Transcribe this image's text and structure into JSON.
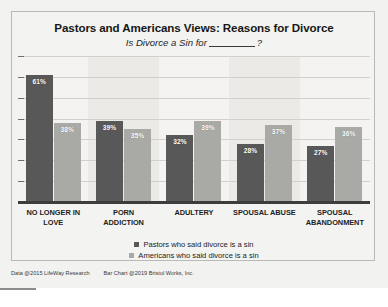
{
  "chart_data": {
    "type": "bar",
    "title": "Pastors and Americans Views: Reasons for Divorce",
    "subtitle_prefix": "Is Divorce a Sin for",
    "subtitle_suffix": "?",
    "categories": [
      "NO LONGER IN LOVE",
      "PORN ADDICTION",
      "ADULTERY",
      "SPOUSAL ABUSE",
      "SPOUSAL ABANDONMENT"
    ],
    "category_lines": [
      [
        "NO LONGER IN",
        "LOVE"
      ],
      [
        "PORN",
        "ADDICTION"
      ],
      [
        "ADULTERY",
        ""
      ],
      [
        "SPOUSAL ABUSE",
        ""
      ],
      [
        "SPOUSAL",
        "ABANDONMENT"
      ]
    ],
    "series": [
      {
        "name": "Pastors who said divorce is a sin",
        "color": "#585858",
        "values": [
          61,
          39,
          32,
          28,
          27
        ],
        "labels": [
          "61%",
          "39%",
          "32%",
          "28%",
          "27%"
        ]
      },
      {
        "name": "Americans who said divorce is a sin",
        "color": "#a9a9a5",
        "values": [
          38,
          35,
          39,
          37,
          36
        ],
        "labels": [
          "38%",
          "35%",
          "39%",
          "37%",
          "36%"
        ]
      }
    ],
    "xlabel": "",
    "ylabel": "",
    "ylim": [
      0,
      70
    ],
    "grid": true,
    "legend_position": "bottom",
    "value_labels_inside_bars": true
  },
  "footer": {
    "data_credit": "Data @2015 LifeWay Research",
    "chart_credit": "Bar Chart @2019 Bristol Works, Inc."
  }
}
